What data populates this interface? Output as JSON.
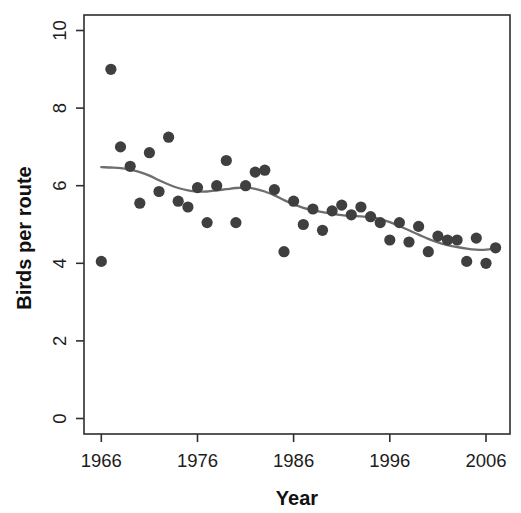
{
  "figure": {
    "background": "#ffffff"
  },
  "chart_data": {
    "type": "scatter",
    "title": "",
    "xlabel": "Year",
    "ylabel": "Birds per route",
    "x_ticks": [
      1966,
      1976,
      1986,
      1996,
      2006
    ],
    "y_ticks": [
      0,
      2,
      4,
      6,
      8,
      10
    ],
    "xlim": [
      1964.2,
      2008.5
    ],
    "ylim": [
      -0.4,
      10.4
    ],
    "grid": false,
    "legend": "none",
    "point_color": "#3f3f3f",
    "smooth_line_color": "#6e6e6e",
    "axis_color": "#2e2e2e",
    "tick_label_color": "#1c1c1c",
    "points": [
      {
        "year": 1966,
        "value": 4.05
      },
      {
        "year": 1967,
        "value": 9.0
      },
      {
        "year": 1968,
        "value": 7.0
      },
      {
        "year": 1969,
        "value": 6.5
      },
      {
        "year": 1970,
        "value": 5.55
      },
      {
        "year": 1971,
        "value": 6.85
      },
      {
        "year": 1972,
        "value": 5.85
      },
      {
        "year": 1973,
        "value": 7.25
      },
      {
        "year": 1974,
        "value": 5.6
      },
      {
        "year": 1975,
        "value": 5.45
      },
      {
        "year": 1976,
        "value": 5.95
      },
      {
        "year": 1977,
        "value": 5.05
      },
      {
        "year": 1978,
        "value": 6.0
      },
      {
        "year": 1979,
        "value": 6.65
      },
      {
        "year": 1980,
        "value": 5.05
      },
      {
        "year": 1981,
        "value": 6.0
      },
      {
        "year": 1982,
        "value": 6.35
      },
      {
        "year": 1983,
        "value": 6.4
      },
      {
        "year": 1984,
        "value": 5.9
      },
      {
        "year": 1985,
        "value": 4.3
      },
      {
        "year": 1986,
        "value": 5.6
      },
      {
        "year": 1987,
        "value": 5.0
      },
      {
        "year": 1988,
        "value": 5.4
      },
      {
        "year": 1989,
        "value": 4.85
      },
      {
        "year": 1990,
        "value": 5.35
      },
      {
        "year": 1991,
        "value": 5.5
      },
      {
        "year": 1992,
        "value": 5.25
      },
      {
        "year": 1993,
        "value": 5.45
      },
      {
        "year": 1994,
        "value": 5.2
      },
      {
        "year": 1995,
        "value": 5.05
      },
      {
        "year": 1996,
        "value": 4.6
      },
      {
        "year": 1997,
        "value": 5.05
      },
      {
        "year": 1998,
        "value": 4.55
      },
      {
        "year": 1999,
        "value": 4.95
      },
      {
        "year": 2000,
        "value": 4.3
      },
      {
        "year": 2001,
        "value": 4.7
      },
      {
        "year": 2002,
        "value": 4.6
      },
      {
        "year": 2003,
        "value": 4.6
      },
      {
        "year": 2004,
        "value": 4.05
      },
      {
        "year": 2005,
        "value": 4.65
      },
      {
        "year": 2006,
        "value": 4.0
      },
      {
        "year": 2007,
        "value": 4.4
      }
    ],
    "smooth_line": [
      [
        1966,
        6.48
      ],
      [
        1967,
        6.47
      ],
      [
        1968,
        6.45
      ],
      [
        1969,
        6.41
      ],
      [
        1970,
        6.35
      ],
      [
        1971,
        6.26
      ],
      [
        1972,
        6.14
      ],
      [
        1973,
        6.03
      ],
      [
        1974,
        5.94
      ],
      [
        1975,
        5.88
      ],
      [
        1976,
        5.85
      ],
      [
        1977,
        5.85
      ],
      [
        1978,
        5.88
      ],
      [
        1979,
        5.91
      ],
      [
        1980,
        5.94
      ],
      [
        1981,
        5.95
      ],
      [
        1982,
        5.92
      ],
      [
        1983,
        5.85
      ],
      [
        1984,
        5.75
      ],
      [
        1985,
        5.63
      ],
      [
        1986,
        5.52
      ],
      [
        1987,
        5.43
      ],
      [
        1988,
        5.37
      ],
      [
        1989,
        5.32
      ],
      [
        1990,
        5.28
      ],
      [
        1991,
        5.24
      ],
      [
        1992,
        5.22
      ],
      [
        1993,
        5.21
      ],
      [
        1994,
        5.19
      ],
      [
        1995,
        5.14
      ],
      [
        1996,
        5.06
      ],
      [
        1997,
        4.96
      ],
      [
        1998,
        4.85
      ],
      [
        1999,
        4.74
      ],
      [
        2000,
        4.63
      ],
      [
        2001,
        4.54
      ],
      [
        2002,
        4.47
      ],
      [
        2003,
        4.42
      ],
      [
        2004,
        4.38
      ],
      [
        2005,
        4.35
      ],
      [
        2006,
        4.35
      ],
      [
        2007,
        4.4
      ]
    ]
  }
}
